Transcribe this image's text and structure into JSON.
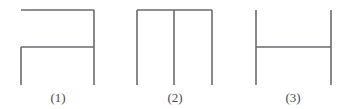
{
  "page": {
    "background_color": "#ffffff",
    "width": 345,
    "height": 109
  },
  "style": {
    "stroke_color": "#6a6a70",
    "stroke_width": 1.6,
    "caption_color": "#4a4a52",
    "caption_font_size": 13
  },
  "figures": [
    {
      "id": "figure-1",
      "caption": "(1)",
      "description": "Top horizontal bar with right vertical post running full height, plus a middle horizontal bar with a left vertical post running down from it",
      "segments": [
        {
          "name": "top-horizontal",
          "x1": 21,
          "y1": 10,
          "x2": 94,
          "y2": 10
        },
        {
          "name": "right-vertical",
          "x1": 94,
          "y1": 10,
          "x2": 94,
          "y2": 85
        },
        {
          "name": "middle-horizontal",
          "x1": 21,
          "y1": 47,
          "x2": 94,
          "y2": 47
        },
        {
          "name": "left-vertical",
          "x1": 21,
          "y1": 47,
          "x2": 21,
          "y2": 85
        }
      ]
    },
    {
      "id": "figure-2",
      "caption": "(2)",
      "description": "Top horizontal bar with three vertical posts hanging down: left, middle and right",
      "segments": [
        {
          "name": "top-horizontal",
          "x1": 137,
          "y1": 10,
          "x2": 212,
          "y2": 10
        },
        {
          "name": "left-vertical",
          "x1": 137,
          "y1": 10,
          "x2": 137,
          "y2": 85
        },
        {
          "name": "middle-vertical",
          "x1": 174,
          "y1": 10,
          "x2": 174,
          "y2": 85
        },
        {
          "name": "right-vertical",
          "x1": 212,
          "y1": 10,
          "x2": 212,
          "y2": 85
        }
      ]
    },
    {
      "id": "figure-3",
      "caption": "(3)",
      "description": "Two full-height vertical posts joined by a horizontal crossbar at mid height, forming an H shape",
      "segments": [
        {
          "name": "left-vertical",
          "x1": 256,
          "y1": 10,
          "x2": 256,
          "y2": 85
        },
        {
          "name": "right-vertical",
          "x1": 331,
          "y1": 10,
          "x2": 331,
          "y2": 85
        },
        {
          "name": "middle-horizontal",
          "x1": 256,
          "y1": 47,
          "x2": 331,
          "y2": 47
        }
      ]
    }
  ]
}
